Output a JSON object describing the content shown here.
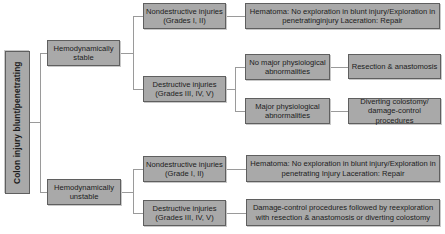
{
  "diagram": {
    "root": "Colon injury blunt/penetrating",
    "stable": {
      "label": "Hemodynamically stable",
      "nondestructive": {
        "label": "Nondestructive injuries (Grades I, II)",
        "management": "Hematoma: No exploration in blunt injury/Exploration in penetratinginjury Laceration: Repair"
      },
      "destructive": {
        "label": "Destructive injuries (Grades III, IV, V)",
        "no_major": {
          "label": "No major physiological abnormalities",
          "management": "Resection & anastomosis"
        },
        "major": {
          "label": "Major physiological abnormalities",
          "management": "Diverting colostomy/ damage-control procedures"
        }
      }
    },
    "unstable": {
      "label": "Hemodynamically unstable",
      "nondestructive": {
        "label": "Nondestructive injuries (Grade I, II)",
        "management": "Hematoma: No exploration in blunt injury/Exploration in penetrating Injury Laceration: Repair"
      },
      "destructive": {
        "label": "Destructive injuries (Grades III, IV, V)",
        "management": "Damage-control procedures followed by reexploration with resection & anastomosis or diverting colostomy"
      }
    }
  }
}
